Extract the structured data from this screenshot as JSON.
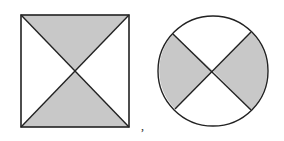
{
  "figures": [
    {
      "shape": "square",
      "description": "square with both diagonals; top and bottom triangles shaded",
      "shaded_regions": [
        "top",
        "bottom"
      ]
    },
    {
      "shape": "circle",
      "description": "circle with two crossing chords; left and right regions shaded",
      "shaded_regions": [
        "left",
        "right"
      ]
    }
  ],
  "separator": ",",
  "colors": {
    "shade": "#c8c8c8",
    "stroke": "#222222",
    "background": "#ffffff"
  }
}
